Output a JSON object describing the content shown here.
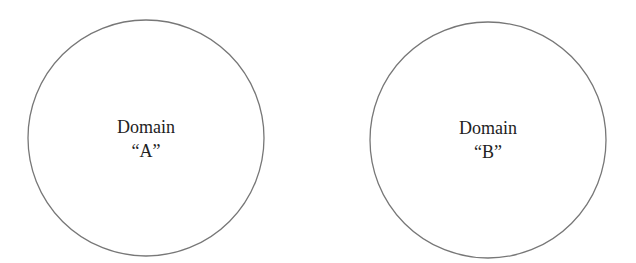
{
  "diagram": {
    "type": "two-domain-circles",
    "stroke_color": "#777777",
    "text_color": "#222222",
    "domains": [
      {
        "id": "A",
        "line1": "Domain",
        "line2": "“A”",
        "circle": {
          "cx": 146,
          "cy": 138,
          "r": 118
        }
      },
      {
        "id": "B",
        "line1": "Domain",
        "line2": "“B”",
        "circle": {
          "cx": 488,
          "cy": 140,
          "r": 118
        }
      }
    ]
  }
}
